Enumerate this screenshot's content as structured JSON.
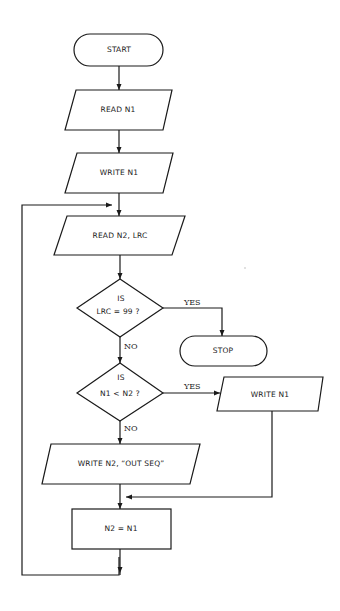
{
  "flowchart": {
    "nodes": {
      "start": {
        "type": "terminal",
        "label": "START"
      },
      "read_n1": {
        "type": "io",
        "label": "READ N1"
      },
      "write_n1_first": {
        "type": "io",
        "label": "WRITE N1"
      },
      "read_n2_lrc": {
        "type": "io",
        "label": "READ N2, LRC"
      },
      "decision_lrc": {
        "type": "decision",
        "line1": "IS",
        "line2": "LRC = 99 ?"
      },
      "stop": {
        "type": "terminal",
        "label": "STOP"
      },
      "decision_n1_n2": {
        "type": "decision",
        "line1": "IS",
        "line2": "N1 < N2 ?"
      },
      "write_n1_second": {
        "type": "io",
        "label": "WRITE N1"
      },
      "write_out_seq": {
        "type": "io",
        "label": "WRITE N2, “OUT SEQ”"
      },
      "assign": {
        "type": "process",
        "label": "N2 = N1"
      }
    },
    "edges": {
      "lrc_yes": "YES",
      "lrc_no": "NO",
      "n1n2_yes": "YES",
      "n1n2_no": "NO"
    },
    "colors": {
      "stroke": "#1a1a1a",
      "background": "#ffffff"
    }
  }
}
